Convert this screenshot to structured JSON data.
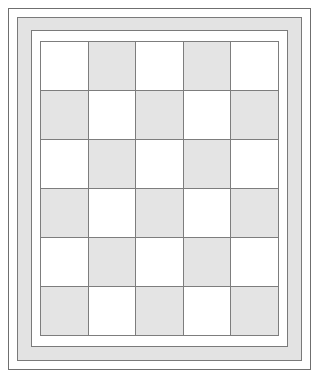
{
  "diagram": {
    "kind": "quilt-block-schematic",
    "frame": {
      "outer_edge_label": "outer quilt edge",
      "border_band_label": "border strip",
      "inner_gap_label": "inner background gap"
    },
    "colors": {
      "page_background": "#ffffff",
      "light_patch": "#ffffff",
      "dark_patch": "#e4e4e4",
      "border_band": "#e3e3e3",
      "grid_line": "#7d7d7d",
      "outline": "#6f6f6f"
    }
  },
  "chart_data": {
    "type": "heatmap",
    "xlabel": "",
    "ylabel": "",
    "columns": 5,
    "rows": 6,
    "legend": [
      "light",
      "dark"
    ],
    "grid": true,
    "values": [
      [
        "light",
        "dark",
        "light",
        "dark",
        "light"
      ],
      [
        "dark",
        "light",
        "dark",
        "light",
        "dark"
      ],
      [
        "light",
        "dark",
        "light",
        "dark",
        "light"
      ],
      [
        "dark",
        "light",
        "dark",
        "light",
        "dark"
      ],
      [
        "light",
        "dark",
        "light",
        "dark",
        "light"
      ],
      [
        "dark",
        "light",
        "dark",
        "light",
        "dark"
      ]
    ]
  }
}
